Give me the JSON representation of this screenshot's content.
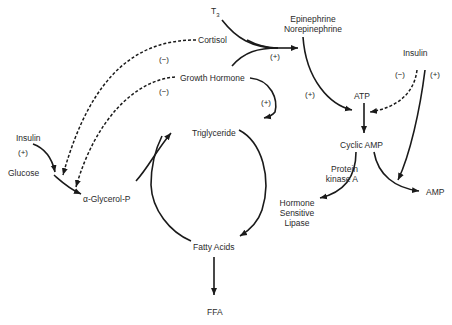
{
  "nodes": {
    "t3": "T",
    "t3_sub": "3",
    "epi": "Epinephrine",
    "norepi": "Norepinephrine",
    "cortisol": "Cortisol",
    "growth_hormone": "Growth Hormone",
    "insulin_right": "Insulin",
    "atp": "ATP",
    "cyclic_amp": "Cyclic AMP",
    "amp": "AMP",
    "protein_kinase_1": "Protein",
    "protein_kinase_2": "kinase A",
    "hsl_1": "Hormone",
    "hsl_2": "Sensitive",
    "hsl_3": "Lipase",
    "triglyceride": "Triglyceride",
    "insulin_left": "Insulin",
    "glucose": "Glucose",
    "glycerol_p": "α-Glycerol-P",
    "fatty_acids": "Fatty Acids",
    "ffa": "FFA"
  },
  "signs": {
    "cortisol_inhib": "(−)",
    "gh_inhib": "(−)",
    "converge_plus": "(+)",
    "gh_plus": "(+)",
    "epi_plus": "(+)",
    "insulin_right_minus": "(−)",
    "insulin_right_plus": "(+)",
    "insulin_left_plus": "(+)"
  },
  "colors": {
    "stroke": "#1a1a1a",
    "text": "#2a2a2a",
    "background": "#ffffff"
  }
}
